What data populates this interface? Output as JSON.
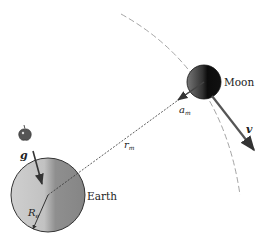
{
  "labels": {
    "moon": "Moon",
    "earth": "Earth",
    "accel_moon": "a",
    "accel_moon_sub": "m",
    "velocity": "v",
    "radius_moon": "r",
    "radius_moon_sub": "m",
    "gravity": "g",
    "radius_earth": "R",
    "radius_earth_sub": "e"
  },
  "colors": {
    "earth_light": "#d4d4d4",
    "earth_dark": "#8a8a8a",
    "moon_light": "#6a6a6a",
    "moon_dark": "#111111",
    "arrow": "#444444",
    "orbit": "#9a9a9a"
  }
}
